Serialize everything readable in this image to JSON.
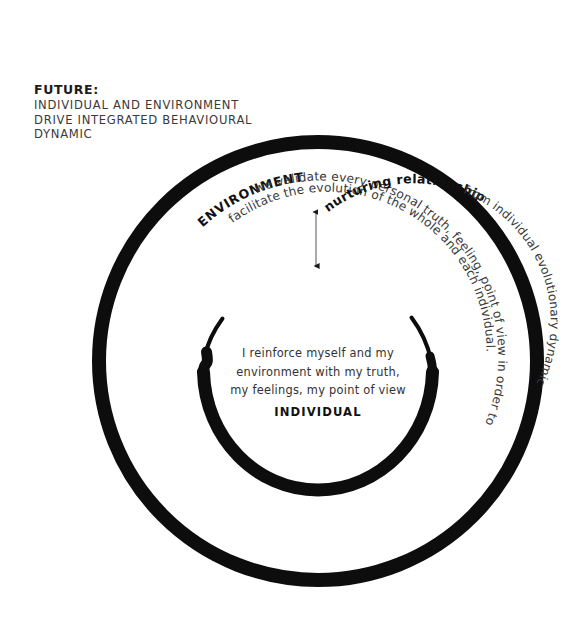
{
  "diagram": {
    "title_label": "FUTURE:",
    "subtitle_lines": [
      "INDIVIDUAL AND ENVIRONMENT",
      "DRIVE INTEGRATED BEHAVIOURAL",
      "DYNAMIC"
    ],
    "outer_label": "ENVIRONMENT",
    "outer_arc_line_1": "we validate every personal truth, feeling, point of view in order to",
    "outer_arc_line_2": "facilitate the evolution of the whole and each individual.",
    "middle_label": "nurturing relationship",
    "middle_arc_text": "from individual evolutionary dynamic",
    "center_lines": [
      "I reinforce myself and my",
      "environment with my truth,",
      "my feelings, my point of view"
    ],
    "center_label": "INDIVIDUAL",
    "arrow_name": "double-headed-vertical-arrow",
    "colors": {
      "stroke": "#0d0d0d",
      "text_dark": "#1c1c1c",
      "text_body": "#333333",
      "background": "#ffffff"
    },
    "geometry": {
      "outer_circle_center_x": 318,
      "outer_circle_center_y": 361,
      "outer_circle_radius": 219,
      "outer_circle_stroke_width": 14,
      "inner_spiral_radius": 118,
      "arrow_x": 316,
      "arrow_top_y": 207,
      "arrow_bottom_y": 270
    }
  }
}
